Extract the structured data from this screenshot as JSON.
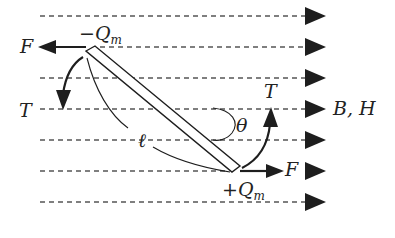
{
  "diagram": {
    "field": {
      "label": "B, H",
      "line_count": 7,
      "line_y": [
        16,
        47,
        78,
        109,
        140,
        171,
        202
      ],
      "direction": "right"
    },
    "poles": {
      "negative": {
        "label_sign": "−",
        "label_symbol": "Q",
        "label_sub": "m"
      },
      "positive": {
        "label_sign": "+",
        "label_symbol": "Q",
        "label_sub": "m"
      }
    },
    "forces": {
      "left": {
        "label": "F"
      },
      "right": {
        "label": "F"
      }
    },
    "torques": {
      "left": {
        "label": "T"
      },
      "right": {
        "label": "T"
      }
    },
    "angle": {
      "label": "θ"
    },
    "length": {
      "label": "ℓ"
    },
    "colors": {
      "ink": "#1e1e1e",
      "dash": "#444444",
      "background": "#ffffff"
    }
  }
}
